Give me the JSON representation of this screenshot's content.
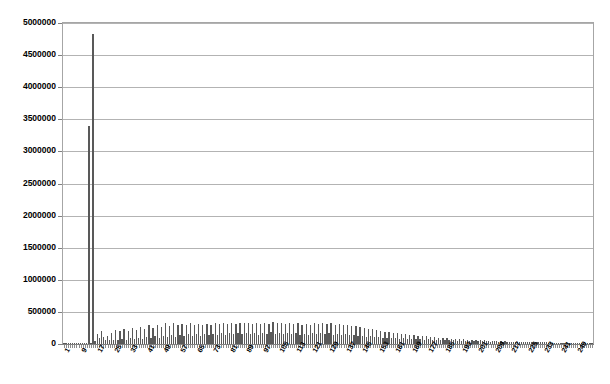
{
  "chart_data": {
    "type": "bar",
    "title": "",
    "subtitle": "",
    "xlabel": "",
    "ylabel": "",
    "legend": [],
    "legend_position": "none",
    "grid": true,
    "ylim": [
      0,
      5000000
    ],
    "ytick_values": [
      0,
      500000,
      1000000,
      1500000,
      2000000,
      2500000,
      3000000,
      3500000,
      4000000,
      4500000,
      5000000
    ],
    "ytick_labels": [
      "0",
      "500000",
      "1000000",
      "1500000",
      "2000000",
      "2500000",
      "3000000",
      "3500000",
      "4000000",
      "4500000",
      "5000000"
    ],
    "xtick_labels": [
      "1",
      "9",
      "17",
      "25",
      "33",
      "41",
      "49",
      "57",
      "65",
      "73",
      "81",
      "89",
      "97",
      "105",
      "113",
      "121",
      "129",
      "137",
      "145",
      "153",
      "161",
      "169",
      "177",
      "185",
      "193",
      "201",
      "209",
      "217",
      "225",
      "233",
      "241",
      "249"
    ],
    "xtick_step": 8,
    "x_first": 1,
    "x_last": 256,
    "bar_color": "#595959",
    "grid_color": "#b3b3b3",
    "axis_color": "#a6a6a6",
    "categories": [
      1,
      2,
      3,
      4,
      5,
      6,
      7,
      8,
      9,
      10,
      11,
      12,
      13,
      14,
      15,
      16,
      17,
      18,
      19,
      20,
      21,
      22,
      23,
      24,
      25,
      26,
      27,
      28,
      29,
      30,
      31,
      32,
      33,
      34,
      35,
      36,
      37,
      38,
      39,
      40,
      41,
      42,
      43,
      44,
      45,
      46,
      47,
      48,
      49,
      50,
      51,
      52,
      53,
      54,
      55,
      56,
      57,
      58,
      59,
      60,
      61,
      62,
      63,
      64,
      65,
      66,
      67,
      68,
      69,
      70,
      71,
      72,
      73,
      74,
      75,
      76,
      77,
      78,
      79,
      80,
      81,
      82,
      83,
      84,
      85,
      86,
      87,
      88,
      89,
      90,
      91,
      92,
      93,
      94,
      95,
      96,
      97,
      98,
      99,
      100,
      101,
      102,
      103,
      104,
      105,
      106,
      107,
      108,
      109,
      110,
      111,
      112,
      113,
      114,
      115,
      116,
      117,
      118,
      119,
      120,
      121,
      122,
      123,
      124,
      125,
      126,
      127,
      128,
      129,
      130,
      131,
      132,
      133,
      134,
      135,
      136,
      137,
      138,
      139,
      140,
      141,
      142,
      143,
      144,
      145,
      146,
      147,
      148,
      149,
      150,
      151,
      152,
      153,
      154,
      155,
      156,
      157,
      158,
      159,
      160,
      161,
      162,
      163,
      164,
      165,
      166,
      167,
      168,
      169,
      170,
      171,
      172,
      173,
      174,
      175,
      176,
      177,
      178,
      179,
      180,
      181,
      182,
      183,
      184,
      185,
      186,
      187,
      188,
      189,
      190,
      191,
      192,
      193,
      194,
      195,
      196,
      197,
      198,
      199,
      200,
      201,
      202,
      203,
      204,
      205,
      206,
      207,
      208,
      209,
      210,
      211,
      212,
      213,
      214,
      215,
      216,
      217,
      218,
      219,
      220,
      221,
      222,
      223,
      224,
      225,
      226,
      227,
      228,
      229,
      230,
      231,
      232,
      233,
      234,
      235,
      236,
      237,
      238,
      239,
      240,
      241,
      242,
      243,
      244,
      245,
      246,
      247,
      248,
      249,
      250,
      251,
      252,
      253,
      254,
      255,
      256
    ],
    "values": [
      4000,
      3000,
      5000,
      4000,
      6000,
      5000,
      7000,
      6000,
      8000,
      7000,
      9000,
      8000,
      3400000,
      12000,
      4830000,
      40000,
      150000,
      95000,
      210000,
      110000,
      60000,
      130000,
      55000,
      175000,
      70000,
      215000,
      60000,
      195000,
      85000,
      240000,
      70000,
      205000,
      90000,
      250000,
      75000,
      225000,
      100000,
      265000,
      80000,
      230000,
      110000,
      290000,
      95000,
      255000,
      120000,
      300000,
      100000,
      270000,
      130000,
      320000,
      105000,
      285000,
      140000,
      335000,
      115000,
      300000,
      145000,
      310000,
      120000,
      290000,
      150000,
      320000,
      125000,
      300000,
      155000,
      310000,
      130000,
      295000,
      150000,
      315000,
      135000,
      300000,
      160000,
      320000,
      140000,
      305000,
      165000,
      325000,
      145000,
      310000,
      170000,
      330000,
      150000,
      315000,
      175000,
      335000,
      155000,
      320000,
      170000,
      330000,
      150000,
      310000,
      165000,
      325000,
      145000,
      305000,
      175000,
      335000,
      155000,
      315000,
      180000,
      340000,
      160000,
      320000,
      175000,
      330000,
      155000,
      310000,
      170000,
      325000,
      150000,
      305000,
      165000,
      320000,
      145000,
      300000,
      160000,
      315000,
      140000,
      295000,
      170000,
      330000,
      150000,
      310000,
      175000,
      335000,
      155000,
      315000,
      165000,
      325000,
      145000,
      300000,
      160000,
      310000,
      140000,
      290000,
      155000,
      300000,
      135000,
      280000,
      145000,
      285000,
      125000,
      265000,
      130000,
      255000,
      115000,
      235000,
      120000,
      230000,
      105000,
      215000,
      110000,
      205000,
      95000,
      190000,
      100000,
      185000,
      90000,
      175000,
      95000,
      170000,
      85000,
      160000,
      90000,
      155000,
      80000,
      145000,
      85000,
      140000,
      75000,
      130000,
      80000,
      125000,
      70000,
      118000,
      72000,
      112000,
      65000,
      105000,
      68000,
      100000,
      60000,
      95000,
      62000,
      90000,
      55000,
      85000,
      58000,
      82000,
      52000,
      78000,
      54000,
      74000,
      48000,
      70000,
      50000,
      66000,
      45000,
      62000,
      46000,
      58000,
      42000,
      55000,
      43000,
      52000,
      39000,
      49000,
      40000,
      46000,
      36000,
      43000,
      37000,
      41000,
      33000,
      39000,
      34000,
      37000,
      31000,
      35000,
      32000,
      33000,
      29000,
      31000,
      29000,
      30000,
      27000,
      28000,
      27000,
      27000,
      25000,
      26000,
      25000,
      25000,
      23000,
      24000,
      23000,
      23000,
      21000,
      22000,
      21000,
      21000,
      19000,
      20000,
      19000,
      19000,
      18000,
      18000,
      17000,
      17000,
      16000,
      16000,
      15000,
      15000,
      14000,
      13000
    ]
  }
}
